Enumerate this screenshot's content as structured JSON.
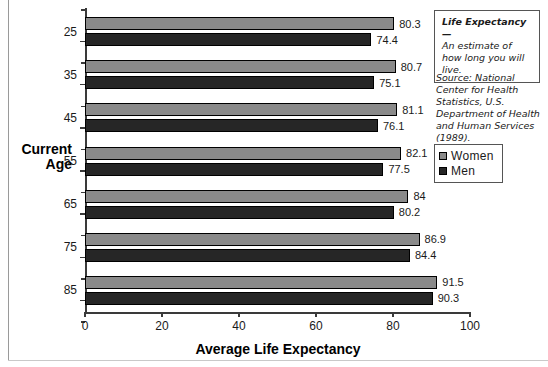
{
  "chart_data": {
    "type": "bar",
    "orientation": "horizontal",
    "title": "",
    "xlabel": "Average Life Expectancy",
    "ylabel": "Current Age",
    "categories": [
      "25",
      "35",
      "45",
      "55",
      "65",
      "75",
      "85"
    ],
    "series": [
      {
        "name": "Women",
        "color": "#8a8a8a",
        "values": [
          80.3,
          80.7,
          81.1,
          82.1,
          84,
          86.9,
          91.5
        ]
      },
      {
        "name": "Men",
        "color": "#262626",
        "values": [
          74.4,
          75.1,
          76.1,
          77.5,
          80.2,
          84.4,
          90.3
        ]
      }
    ],
    "value_labels": {
      "Women": [
        "80.3",
        "80.7",
        "81.1",
        "82.1",
        "84",
        "86.9",
        "91.5"
      ],
      "Men": [
        "74.4",
        "75.1",
        "76.1",
        "77.5",
        "80.2",
        "84.4",
        "90.3"
      ]
    },
    "xlim": [
      0,
      100
    ],
    "xticks": [
      "0",
      "20",
      "40",
      "60",
      "80",
      "100"
    ],
    "grid": false,
    "legend_position": "right"
  },
  "callout": {
    "title": "Life Expectancy—",
    "body": "An estimate of how long you will live."
  },
  "source": {
    "text": "Source: National Center for Health Statistics, U.S. Department of Health and Human Services (1989)."
  },
  "legend": {
    "items": [
      {
        "label": "Women",
        "color": "#8a8a8a"
      },
      {
        "label": "Men",
        "color": "#262626"
      }
    ]
  },
  "axes": {
    "x_title": "Average Life Expectancy",
    "y_title_line1": "Current",
    "y_title_line2": "Age"
  }
}
